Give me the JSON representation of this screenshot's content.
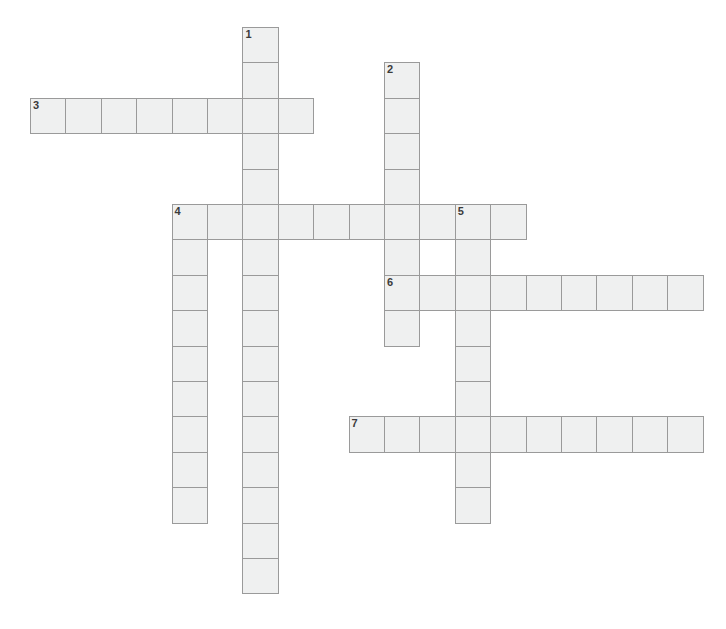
{
  "page": {
    "kind": "crossword-puzzle-grid",
    "width": 726,
    "height": 629,
    "background_color": "#ffffff"
  },
  "grid": {
    "cell_size": 35.4,
    "origin_x": 30,
    "origin_y": 27,
    "cell_fill_color": "#eff0f0",
    "cell_border_color": "#9a9a9a",
    "number_color": "#3b3b3b",
    "columns": 19,
    "rows": 16
  },
  "entries": [
    {
      "number": "1",
      "direction": "down",
      "start_col": 6,
      "start_row": 0,
      "length": 16,
      "letters": ""
    },
    {
      "number": "2",
      "direction": "down",
      "start_col": 10,
      "start_row": 1,
      "length": 8,
      "letters": ""
    },
    {
      "number": "3",
      "direction": "across",
      "start_col": 0,
      "start_row": 2,
      "length": 8,
      "letters": ""
    },
    {
      "number": "4",
      "direction": "across",
      "start_col": 4,
      "start_row": 5,
      "length": 10,
      "letters": ""
    },
    {
      "number": "4",
      "direction": "down",
      "start_col": 4,
      "start_row": 5,
      "length": 9,
      "letters": ""
    },
    {
      "number": "5",
      "direction": "down",
      "start_col": 12,
      "start_row": 5,
      "length": 9,
      "letters": ""
    },
    {
      "number": "6",
      "direction": "across",
      "start_col": 10,
      "start_row": 7,
      "length": 9,
      "letters": ""
    },
    {
      "number": "7",
      "direction": "across",
      "start_col": 9,
      "start_row": 11,
      "length": 10,
      "letters": ""
    }
  ],
  "numbered_cells": [
    {
      "number": "1",
      "col": 6,
      "row": 0
    },
    {
      "number": "2",
      "col": 10,
      "row": 1
    },
    {
      "number": "3",
      "col": 0,
      "row": 2
    },
    {
      "number": "4",
      "col": 4,
      "row": 5
    },
    {
      "number": "5",
      "col": 12,
      "row": 5
    },
    {
      "number": "6",
      "col": 10,
      "row": 7
    },
    {
      "number": "7",
      "col": 9,
      "row": 11
    }
  ]
}
